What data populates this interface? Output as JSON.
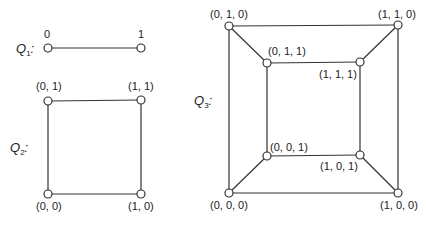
{
  "graphs": {
    "q1": {
      "title": "Q",
      "subscript": "1",
      "suffix": ":",
      "nodes": [
        {
          "label": "0",
          "x": 48,
          "y": 48
        },
        {
          "label": "1",
          "x": 141,
          "y": 48
        }
      ]
    },
    "q2": {
      "title": "Q",
      "subscript": "2",
      "suffix": ":",
      "nodes": [
        {
          "label": "(0, 1)",
          "x": 48,
          "y": 101
        },
        {
          "label": "(1, 1)",
          "x": 141,
          "y": 100
        },
        {
          "label": "(0, 0)",
          "x": 48,
          "y": 194
        },
        {
          "label": "(1, 0)",
          "x": 141,
          "y": 194
        }
      ]
    },
    "q3": {
      "title": "Q",
      "subscript": "3",
      "suffix": ":",
      "nodes": [
        {
          "label": "(0, 1, 0)",
          "x": 229,
          "y": 26
        },
        {
          "label": "(1, 1, 0)",
          "x": 398,
          "y": 25
        },
        {
          "label": "(0, 1, 1)",
          "x": 267,
          "y": 63
        },
        {
          "label": "(1, 1, 1)",
          "x": 360,
          "y": 62
        },
        {
          "label": "(0, 0, 1)",
          "x": 267,
          "y": 156
        },
        {
          "label": "(1, 0, 1)",
          "x": 360,
          "y": 155
        },
        {
          "label": "(0, 0, 0)",
          "x": 229,
          "y": 193
        },
        {
          "label": "(1, 0, 0)",
          "x": 398,
          "y": 193
        }
      ]
    }
  }
}
